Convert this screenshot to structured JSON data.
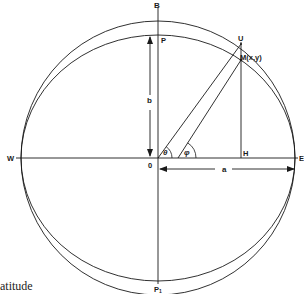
{
  "diagram": {
    "labels": {
      "B": "B",
      "P": "P",
      "U": "U",
      "M": "M(x,y)",
      "b": "b",
      "a": "a",
      "W": "W",
      "E": "E",
      "O": "0",
      "H": "H",
      "P1": "P",
      "P1_sub": "1",
      "theta": "θ",
      "phi": "φ"
    },
    "caption": "atitude",
    "colors": {
      "stroke": "#1a1a1a",
      "background": "#ffffff"
    }
  }
}
